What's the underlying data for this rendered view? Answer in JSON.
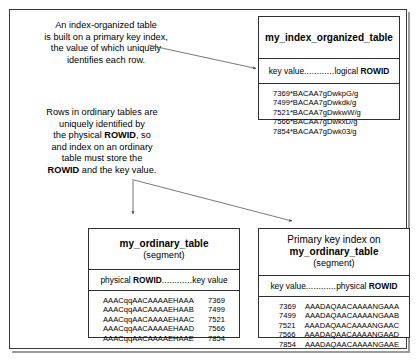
{
  "figure": {
    "caption_top": [
      "An index-organized table",
      "is built on a primary key index,",
      "the value of which uniquely",
      "identifies each row."
    ],
    "caption_bottom": [
      "Rows in ordinary tables are",
      "uniquely identified by",
      "the physical ROWID, so",
      "and index on an ordinary",
      "table must store the",
      "ROWID and the key value."
    ]
  },
  "index_organized_table": {
    "title": "my_index_organized_table",
    "column_header_left": "key value",
    "column_header_dots": "............",
    "column_header_right_plain": "logical ",
    "column_header_right_bold": "ROWID",
    "rows": [
      "7369*BACAA7gDwkpG/g",
      "7499*BACAA7gDwkdk/g",
      "7521*BACAA7gDwkwW/g",
      "7566*BACAA7gDwkxD/g",
      "7854*BACAA7gDwk03/g"
    ]
  },
  "ordinary_table": {
    "title": "my_ordinary_table",
    "subtitle": "(segment)",
    "column_header_left_plain": "physical ",
    "column_header_left_bold": "ROWID",
    "column_header_dots": "............",
    "column_header_right": "key value",
    "rows": [
      {
        "rowid": "AAACqqAACAAAAEHAAA",
        "key": "7369"
      },
      {
        "rowid": "AAACqqAACAAAAEHAAB",
        "key": "7499"
      },
      {
        "rowid": "AAACqqAACAAAAEHAAC",
        "key": "7521"
      },
      {
        "rowid": "AAACqqAACAAAAEHAAD",
        "key": "7566"
      },
      {
        "rowid": "AAACqqAACAAAAEHAAE",
        "key": "7854"
      }
    ]
  },
  "primary_key_index": {
    "title_lead": "Primary key index on",
    "title": "my_ordinary_table",
    "subtitle": "(segment)",
    "column_header_left": "key value",
    "column_header_dots": "............",
    "column_header_right_plain": "physical ",
    "column_header_right_bold": "ROWID",
    "rows": [
      {
        "key": "7369",
        "rowid": "AAADAQAACAAAANGAAA"
      },
      {
        "key": "7499",
        "rowid": "AAADAQAACAAAANGAAB"
      },
      {
        "key": "7521",
        "rowid": "AAADAQAACAAAANGAAC"
      },
      {
        "key": "7566",
        "rowid": "AAADAQAACAAAANGAAD"
      },
      {
        "key": "7854",
        "rowid": "AAADAQAACAAAANGAAE"
      }
    ]
  },
  "colors": {
    "frame": "#3a3a3a",
    "box_border": "#2e2e2e",
    "connector": "#555555",
    "text": "#000000",
    "background": "#ffffff"
  }
}
